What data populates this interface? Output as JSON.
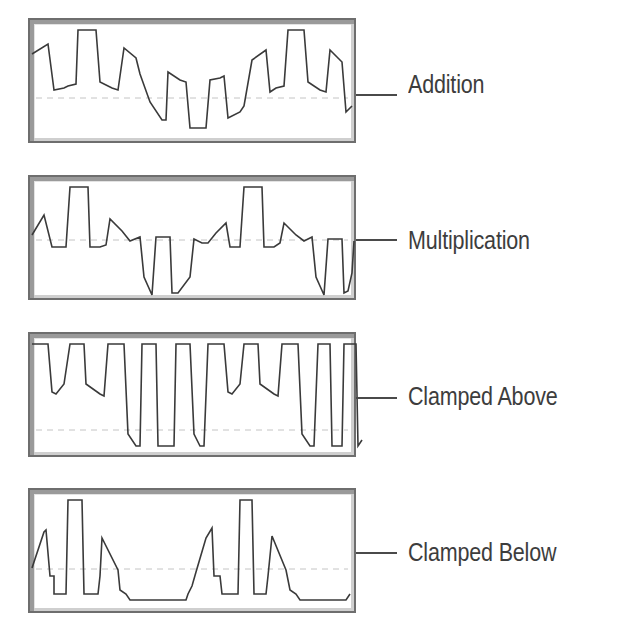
{
  "figure": {
    "note": "Waveform polylines are hand-estimated traces from the screenshot, not measured signal data",
    "panels": [
      {
        "label": "Addition",
        "top": 18,
        "midline_y": 78,
        "connector_y": 76,
        "points": "2,34 18,24 24,70 34,68 38,66 46,64 48,10 66,10 70,62 82,68 88,70 94,28 106,38 110,54 120,82 132,100 136,100 138,52 150,60 156,62 160,108 176,108 180,60 190,58 194,56 198,98 210,92 214,86 222,40 236,30 240,72 246,68 254,66 258,10 274,10 278,62 290,70 296,72 300,30 312,42 316,92 322,86"
      },
      {
        "label": "Multiplication",
        "top": 175,
        "midline_y": 63,
        "connector_y": 64,
        "points": "2,58 14,38 22,70 36,70 40,10 58,10 60,70 70,70 76,68 80,42 92,54 100,64 110,60 114,100 122,118 126,60 140,60 142,116 148,116 160,100 164,62 172,66 178,66 186,56 196,46 200,70 210,70 214,10 232,10 234,70 244,70 250,66 254,46 266,58 274,64 282,60 286,100 294,118 298,62 312,62 314,116 318,114 322,96 324,64"
      },
      {
        "label": "Clamped Above",
        "top": 332,
        "midline_y": 96,
        "connector_y": 60,
        "points": "2,10 18,10 22,58 26,60 34,50 40,10 54,10 56,50 70,60 74,62 78,10 94,10 98,100 106,112 110,112 112,10 126,10 128,112 144,112 146,10 160,10 164,100 170,112 174,112 178,10 194,10 198,58 202,60 210,50 214,10 228,10 230,50 244,60 248,62 252,10 268,10 272,100 280,112 284,112 288,10 300,10 302,112 312,112 314,10 326,10 328,112 332,106"
      },
      {
        "label": "Clamped Below",
        "top": 488,
        "midline_y": 79,
        "connector_y": 62,
        "points": "2,78 14,42 16,40 20,86 24,86 24,104 36,104 38,10 52,10 54,104 68,104 70,86 72,48 88,80 90,100 96,104 100,110 156,110 158,104 162,96 166,82 176,48 182,38 184,86 190,86 192,104 208,104 210,10 222,10 224,104 236,104 238,86 242,46 256,80 260,100 266,104 270,110 316,110 320,104"
      }
    ]
  }
}
